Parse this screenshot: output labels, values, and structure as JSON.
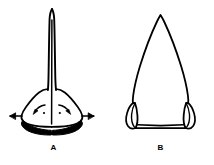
{
  "plate": {
    "name": "two-point-forms-plate",
    "background_color": "#ffffff",
    "ink_color": "#000000",
    "width": 214,
    "height": 165
  },
  "figures": [
    {
      "id": "a",
      "label": "A",
      "title": "Figure A",
      "description": "Narrow elongated spike-like point with a flared expanding base, solid black basal lobes, and motion arrows",
      "icon": "projectile-point-spike-icon",
      "annotations": {
        "left_arrow": "left-outward-arrow",
        "right_arrow": "right-outward-arrow",
        "left_curved_arrow": "left-curved-arrow",
        "right_curved_arrow": "right-curved-arrow"
      }
    },
    {
      "id": "b",
      "label": "B",
      "title": "Figure B",
      "description": "Broad triangular point with paired recurved barbs or tangs at the base",
      "icon": "projectile-point-barbed-icon",
      "annotations": {}
    }
  ]
}
